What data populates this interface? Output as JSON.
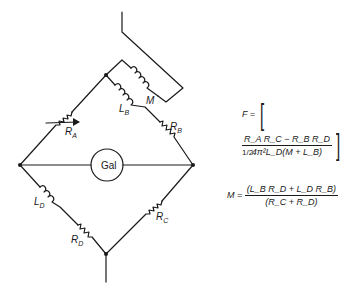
{
  "diagram": {
    "type": "bridge-circuit",
    "nodes": [
      "top",
      "left",
      "right",
      "bottom"
    ],
    "components": {
      "RA": {
        "label": "R",
        "sub": "A",
        "kind": "variable-resistor"
      },
      "RB": {
        "label": "R",
        "sub": "B",
        "kind": "resistor"
      },
      "RC": {
        "label": "R",
        "sub": "C",
        "kind": "resistor"
      },
      "RD": {
        "label": "R",
        "sub": "D",
        "kind": "resistor"
      },
      "LB": {
        "label": "L",
        "sub": "B",
        "kind": "inductor"
      },
      "LD": {
        "label": "L",
        "sub": "D",
        "kind": "inductor"
      },
      "M": {
        "label": "M",
        "kind": "mutual-inductor"
      },
      "gal": {
        "label": "Gal",
        "kind": "galvanometer"
      }
    }
  },
  "equations": {
    "F": {
      "lhs": "F =",
      "numerator": "R_A R_C − R_B R_D",
      "denominator": "4π²L_D(M + L_B)",
      "exponent": "1/2"
    },
    "M": {
      "lhs": "M =",
      "numerator": "(L_B R_D + L_D R_B)",
      "denominator": "(R_C + R_D)"
    }
  }
}
